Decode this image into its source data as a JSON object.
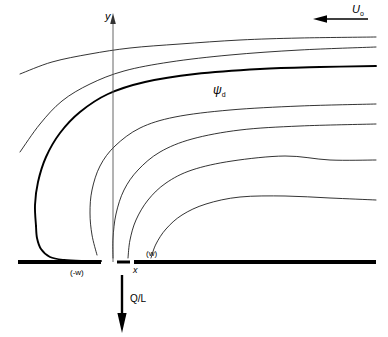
{
  "figure": {
    "background_color": "#ffffff",
    "line_color": "#000000",
    "thin_line_width": 0.8,
    "bold_line_width": 1.9,
    "wall_line_width": 4
  },
  "labels": {
    "y_axis": "y",
    "x_axis": "x",
    "free_stream": "U",
    "free_stream_sub": "o",
    "dividing_streamline": "ψ",
    "dividing_streamline_sub": "d",
    "sink_left_edge": "(-w)",
    "sink_right_edge": "(w)",
    "sink_strength": "Q/L"
  },
  "arrows": {
    "free_stream_direction": "left",
    "free_stream_arrow": {
      "x1": 368,
      "y1": 19,
      "x2": 316,
      "y2": 19
    },
    "sink_direction": "down",
    "sink_arrow": {
      "x1": 122,
      "y1": 275,
      "x2": 122,
      "y2": 331
    },
    "y_axis_direction": "up"
  },
  "axes": {
    "y_axis": {
      "x": 113,
      "y_top": 18,
      "y_bottom": 262
    },
    "baseline_y": 262,
    "wall_left": {
      "x_start": 18,
      "x_end": 101
    },
    "wall_right": {
      "x_start": 134,
      "x_end": 376
    },
    "origin_x": 113
  },
  "chart_data": {
    "type": "line",
    "xlabel": "x",
    "ylabel": "y",
    "xlim": [
      18,
      376
    ],
    "ylim": [
      262,
      18
    ],
    "grid": false,
    "legend": null,
    "annotations": [
      {
        "text": "U_o",
        "x": 352,
        "y": 10,
        "note": "free-stream velocity, directed in -x"
      },
      {
        "text": "psi_d",
        "x": 219,
        "y": 90,
        "note": "dividing streamline (bold)"
      },
      {
        "text": "(-w)",
        "x": 80,
        "y": 273,
        "note": "left edge of sink slot"
      },
      {
        "text": "(w)",
        "x": 152,
        "y": 254,
        "note": "right edge of sink slot"
      },
      {
        "text": "Q/L",
        "x": 140,
        "y": 299,
        "note": "volumetric sink strength per unit length"
      }
    ],
    "series": [
      {
        "name": "streamline-1",
        "style": "thin",
        "points": [
          [
            20,
            74
          ],
          [
            52,
            62
          ],
          [
            90,
            54
          ],
          [
            130,
            48
          ],
          [
            180,
            44
          ],
          [
            240,
            40
          ],
          [
            300,
            38
          ],
          [
            376,
            37
          ]
        ]
      },
      {
        "name": "streamline-2",
        "style": "thin",
        "points": [
          [
            20,
            152
          ],
          [
            40,
            124
          ],
          [
            62,
            101
          ],
          [
            90,
            84
          ],
          [
            124,
            71
          ],
          [
            170,
            62
          ],
          [
            230,
            55
          ],
          [
            300,
            50
          ],
          [
            376,
            47
          ]
        ]
      },
      {
        "name": "dividing-streamline-psi-d",
        "style": "bold",
        "points": [
          [
            36,
            226
          ],
          [
            35,
            205
          ],
          [
            38,
            182
          ],
          [
            46,
            157
          ],
          [
            60,
            133
          ],
          [
            80,
            112
          ],
          [
            108,
            94
          ],
          [
            145,
            82
          ],
          [
            195,
            74
          ],
          [
            260,
            69
          ],
          [
            320,
            67
          ],
          [
            376,
            66
          ]
        ]
      },
      {
        "name": "dividing-streamline-psi-d-tail",
        "style": "bold",
        "points": [
          [
            36,
            226
          ],
          [
            37,
            238
          ],
          [
            41,
            249
          ],
          [
            50,
            257
          ],
          [
            64,
            260
          ],
          [
            82,
            261
          ],
          [
            101,
            261
          ]
        ]
      },
      {
        "name": "streamline-3",
        "style": "thin",
        "points": [
          [
            97,
            255
          ],
          [
            92,
            235
          ],
          [
            90,
            213
          ],
          [
            92,
            190
          ],
          [
            100,
            166
          ],
          [
            115,
            146
          ],
          [
            140,
            128
          ],
          [
            175,
            117
          ],
          [
            230,
            110
          ],
          [
            300,
            106
          ],
          [
            376,
            104
          ]
        ]
      },
      {
        "name": "streamline-4",
        "style": "thin",
        "points": [
          [
            113,
            258
          ],
          [
            113,
            238
          ],
          [
            116,
            214
          ],
          [
            124,
            190
          ],
          [
            138,
            170
          ],
          [
            160,
            152
          ],
          [
            192,
            139
          ],
          [
            240,
            130
          ],
          [
            300,
            126
          ],
          [
            376,
            124
          ]
        ]
      },
      {
        "name": "streamline-5",
        "style": "thin",
        "points": [
          [
            128,
            258
          ],
          [
            130,
            240
          ],
          [
            136,
            220
          ],
          [
            148,
            200
          ],
          [
            166,
            183
          ],
          [
            192,
            170
          ],
          [
            232,
            161
          ],
          [
            285,
            156
          ],
          [
            330,
            160
          ],
          [
            376,
            160
          ]
        ]
      },
      {
        "name": "streamline-6",
        "style": "thin",
        "points": [
          [
            151,
            258
          ],
          [
            156,
            244
          ],
          [
            166,
            229
          ],
          [
            182,
            215
          ],
          [
            206,
            204
          ],
          [
            240,
            197
          ],
          [
            285,
            196
          ],
          [
            330,
            198
          ],
          [
            376,
            200
          ]
        ]
      }
    ]
  }
}
